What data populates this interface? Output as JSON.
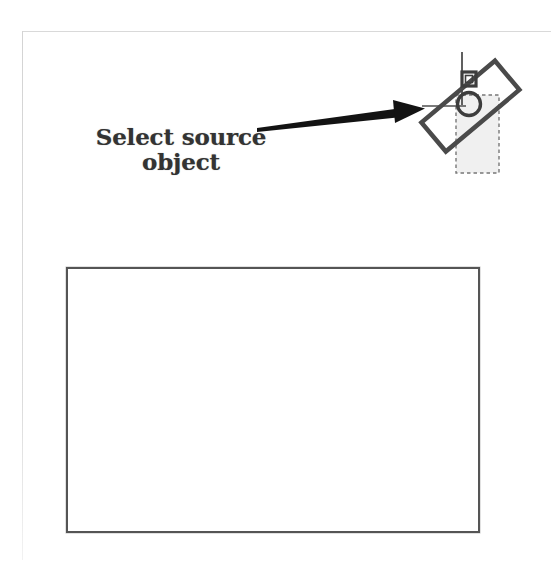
{
  "figure": {
    "title": "Select source object",
    "background_color": "#ffffff",
    "page_border_color": "#d9d9d9"
  },
  "annotation": {
    "caption_line1": "Select source",
    "caption_line2": "object",
    "text_color": "#333333",
    "arrow": {
      "name": "pointer-arrow",
      "direction": "right",
      "color": "#101010",
      "tail_x": 259,
      "tail_y": 126,
      "tip_x": 425,
      "tip_y": 107
    }
  },
  "source_object": {
    "name": "rotated-source-object",
    "rotation_degrees": -40,
    "outline_color": "#4a4a4a",
    "shapes": [
      {
        "name": "rotated-rectangle",
        "type": "rectangle",
        "rotation_degrees": -40
      },
      {
        "name": "circle-shape",
        "type": "circle",
        "center_x": 469,
        "center_y": 104,
        "radius": 11
      },
      {
        "name": "square-handle",
        "type": "square",
        "center_x": 468,
        "center_y": 78,
        "size": 13
      },
      {
        "name": "vertical-guide-line",
        "type": "line",
        "x": 462,
        "y1": 52,
        "y2": 105
      },
      {
        "name": "selection-bounding-box",
        "type": "dashed-rectangle",
        "x": 456,
        "y": 95,
        "width": 43,
        "height": 78,
        "fill": "#ededed",
        "stroke": "#6e6e6e"
      }
    ]
  },
  "destination": {
    "name": "destination-rectangle",
    "x": 66,
    "y": 267,
    "width": 414,
    "height": 266,
    "border_color": "#555555",
    "fill_color": "#ffffff"
  }
}
